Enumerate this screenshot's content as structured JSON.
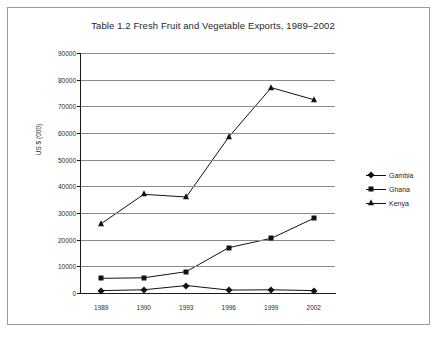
{
  "figure": {
    "background": "#ffffff",
    "border_color": "#9a9a9a"
  },
  "chart_data": {
    "type": "line",
    "title": "Table 1.2 Fresh Fruit and Vegetable Exports, 1989–2002",
    "xlabel": "",
    "ylabel": "US $ (000)",
    "categories": [
      "1989",
      "1990",
      "1993",
      "1996",
      "1999",
      "2002"
    ],
    "ylim": [
      0,
      90000
    ],
    "yticks": [
      0,
      10000,
      20000,
      30000,
      40000,
      50000,
      60000,
      70000,
      80000,
      90000
    ],
    "ytick_labels": [
      "0",
      "10000",
      "20000",
      "30000",
      "40000",
      "50000",
      "60000",
      "70000",
      "80000",
      "90000"
    ],
    "grid": true,
    "grid_axis": "y",
    "legend_position": "right",
    "series": [
      {
        "name": "Gambia",
        "marker": "diamond",
        "color": "#121212",
        "values": [
          900,
          1200,
          2800,
          1100,
          1200,
          900
        ]
      },
      {
        "name": "Ghana",
        "marker": "square",
        "color": "#121212",
        "values": [
          5500,
          5700,
          8000,
          17000,
          20500,
          28000
        ]
      },
      {
        "name": "Kenya",
        "marker": "triangle",
        "color": "#121212",
        "values": [
          26000,
          37000,
          36000,
          58500,
          77000,
          72500
        ]
      }
    ]
  }
}
